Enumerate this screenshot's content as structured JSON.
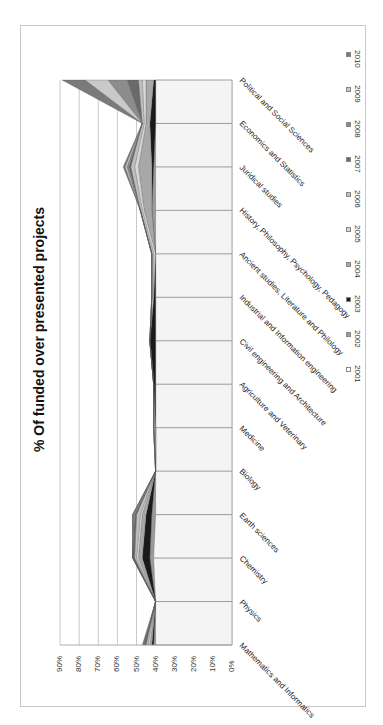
{
  "chart_data": {
    "type": "area",
    "stacked": true,
    "orientation": "rotated-90-clockwise",
    "title": "% Of funded over presented projects",
    "xlabel": "",
    "ylabel": "",
    "ylim": [
      0,
      90
    ],
    "y_ticks": [
      "0%",
      "10%",
      "20%",
      "30%",
      "40%",
      "50%",
      "60%",
      "70%",
      "80%",
      "90%"
    ],
    "grid": true,
    "legend_position": "right",
    "categories": [
      "Mathematics and Informatics",
      "Physics",
      "Chemistry",
      "Earth sciences",
      "Biology",
      "Medicine",
      "Agriculture and Veterinary",
      "Civil engineering and Architecture",
      "Industrial and Information engineering",
      "Ancient studies, Literature and Philology",
      "History, Philosophy, Psychology, Pedagogy",
      "Juridical studies",
      "Economics and Statistics",
      "Political and Social Sciences"
    ],
    "category_labels_display": [
      "Mathematics and Informatics",
      "Physics",
      "Chemistry",
      "Earth sciences",
      "Biology",
      "Medicine",
      "Agriculture and Veterinary",
      "Civil engineering and Architecture",
      "Industrial and Information engineering",
      "Ancient studies, Literature and Philology",
      "History, Philosophy, Psychology, Pedagogy",
      "Juridical studies",
      "Economics and Statistics",
      "Political and Social Sciences"
    ],
    "series": [
      {
        "name": "2001",
        "color": "#f4f4f4",
        "values": [
          40,
          40,
          41,
          40,
          40,
          40,
          40,
          40,
          40,
          40,
          40,
          40,
          40,
          40
        ]
      },
      {
        "name": "2002",
        "color": "#9a9a9a",
        "values": [
          1,
          0,
          2,
          2,
          0,
          0,
          0,
          0,
          0,
          0,
          2,
          1,
          0,
          0
        ]
      },
      {
        "name": "2003",
        "color": "#1a1a1a",
        "values": [
          1,
          0,
          4,
          3,
          0,
          0,
          1,
          3,
          1,
          0,
          0,
          1,
          3,
          1
        ]
      },
      {
        "name": "2004",
        "color": "#a8a8a8",
        "values": [
          1,
          0,
          2,
          2,
          0,
          0,
          0,
          0,
          0,
          0,
          4,
          7,
          2,
          4
        ]
      },
      {
        "name": "2005",
        "color": "#d8d8d8",
        "values": [
          1,
          0,
          1,
          1,
          0,
          0,
          0,
          0,
          0,
          1,
          1,
          2,
          1,
          2
        ]
      },
      {
        "name": "2006",
        "color": "#c0c0c0",
        "values": [
          1,
          0,
          1,
          2,
          0,
          1,
          0,
          0,
          1,
          1,
          1,
          2,
          1,
          2
        ]
      },
      {
        "name": "2007",
        "color": "#6a6a6a",
        "values": [
          1,
          0,
          1,
          1,
          0,
          0,
          0,
          0,
          0,
          0,
          0,
          1,
          0,
          6
        ]
      },
      {
        "name": "2008",
        "color": "#8c8c8c",
        "values": [
          0,
          0,
          0,
          1,
          0,
          0,
          0,
          0,
          0,
          0,
          0,
          1,
          0,
          10
        ]
      },
      {
        "name": "2009",
        "color": "#c9c9c9",
        "values": [
          0,
          0,
          0,
          0,
          0,
          0,
          0,
          0,
          0,
          0,
          0,
          1,
          0,
          12
        ]
      },
      {
        "name": "2010",
        "color": "#7a7a7a",
        "values": [
          1,
          0,
          0,
          0,
          0,
          0,
          0,
          0,
          0,
          0,
          0,
          1,
          0,
          12
        ]
      }
    ],
    "totals_estimated": [
      47,
      40,
      52,
      52,
      40,
      41,
      41,
      43,
      42,
      42,
      48,
      57,
      47,
      89
    ]
  },
  "legend": {
    "items": [
      {
        "label": "2010",
        "color": "#7a7a7a"
      },
      {
        "label": "2009",
        "color": "#c9c9c9"
      },
      {
        "label": "2008",
        "color": "#8c8c8c"
      },
      {
        "label": "2007",
        "color": "#6a6a6a"
      },
      {
        "label": "2006",
        "color": "#c0c0c0"
      },
      {
        "label": "2005",
        "color": "#d8d8d8"
      },
      {
        "label": "2004",
        "color": "#a8a8a8"
      },
      {
        "label": "2003",
        "color": "#1a1a1a"
      },
      {
        "label": "2002",
        "color": "#9a9a9a"
      },
      {
        "label": "2001",
        "color": "#ffffff"
      }
    ]
  },
  "labels": {
    "title": "% Of funded over presented projects",
    "ticks": [
      "90%",
      "80%",
      "70%",
      "60%",
      "50%",
      "40%",
      "30%",
      "20%",
      "10%",
      "0%"
    ],
    "categories": [
      "Political and Social Sciences",
      "Economics and Statistics",
      "Juridical studies",
      "Pedagogy",
      "History, Philosophy, Psychology, Pedagogy",
      "Ancient studies, Literature and Philology...",
      "Industrial and Information engineering",
      "Civil engineering and Architecture",
      "Agriculture and Veterinary",
      "Medicine",
      "Biology",
      "Earth sciences",
      "Chemistry",
      "Physics",
      "Mathematics and Informatics"
    ]
  }
}
